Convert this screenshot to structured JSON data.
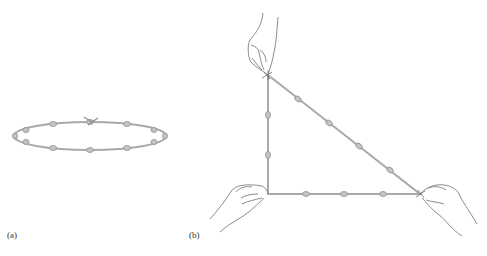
{
  "figure": {
    "panels": [
      {
        "id": "a",
        "label": "(a)",
        "description": "Knotted rope loop laid out as a closed ellipse with 12 evenly spaced knots",
        "knot_count": 12
      },
      {
        "id": "b",
        "label": "(b)",
        "description": "Same knotted rope stretched by three hands into a right triangle with sides 3, 4 and 5 knot-intervals",
        "sides": {
          "vertical": 3,
          "horizontal": 4,
          "hypotenuse": 5
        },
        "knot_count": 12
      }
    ],
    "colors": {
      "rope": "#a9a9a9",
      "knot": "#b5b5b5",
      "hand_outline": "#6e6e6e",
      "background": "#ffffff"
    }
  }
}
